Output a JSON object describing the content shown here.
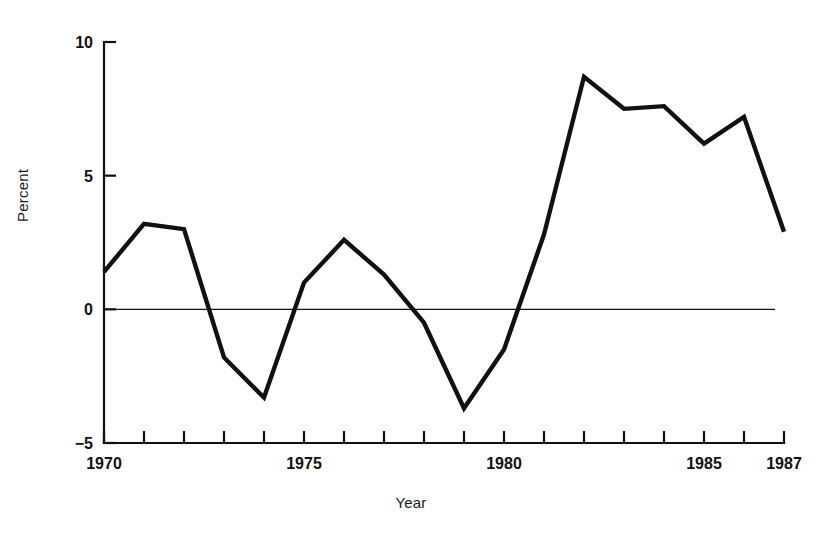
{
  "chart_data": {
    "type": "line",
    "title": "",
    "xlabel": "Year",
    "ylabel": "Percent",
    "x": [
      1970,
      1971,
      1972,
      1973,
      1974,
      1975,
      1976,
      1977,
      1978,
      1979,
      1980,
      1981,
      1982,
      1983,
      1984,
      1985,
      1986,
      1987
    ],
    "values": [
      1.4,
      3.2,
      3.0,
      -1.8,
      -3.3,
      1.0,
      2.6,
      1.3,
      -0.5,
      -3.7,
      -1.5,
      2.8,
      8.7,
      7.5,
      7.6,
      6.2,
      7.2,
      2.9
    ],
    "series": [
      {
        "name": "Percent",
        "values": [
          1.4,
          3.2,
          3.0,
          -1.8,
          -3.3,
          1.0,
          2.6,
          1.3,
          -0.5,
          -3.7,
          -1.5,
          2.8,
          8.7,
          7.5,
          7.6,
          6.2,
          7.2,
          2.9
        ]
      }
    ],
    "xlim": [
      1970,
      1987
    ],
    "ylim": [
      -5,
      10
    ],
    "y_ticks": [
      -5,
      0,
      5,
      10
    ],
    "y_tick_labels": [
      "−5",
      "0",
      "5",
      "10"
    ],
    "x_ticks": [
      1970,
      1971,
      1972,
      1973,
      1974,
      1975,
      1976,
      1977,
      1978,
      1979,
      1980,
      1981,
      1982,
      1983,
      1984,
      1985,
      1986,
      1987
    ],
    "x_tick_labels_shown": [
      "1970",
      "1975",
      "1980",
      "1985",
      "1987"
    ],
    "x_tick_labels_shown_values": [
      1970,
      1975,
      1980,
      1985,
      1987
    ],
    "grid": false,
    "legend": "none",
    "zero_line": true,
    "line_color": "#111111",
    "axis_color": "#111111",
    "background_color": "#ffffff"
  },
  "axes": {
    "y_axis_title": "Percent",
    "x_axis_title": "Year"
  }
}
